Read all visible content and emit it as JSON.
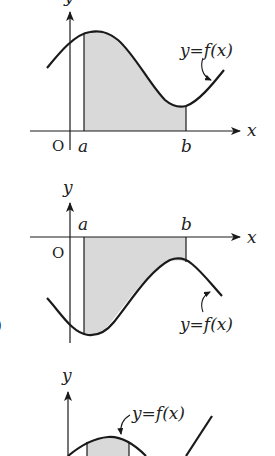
{
  "diagrams": [
    {
      "id": "graph-1",
      "description": "Curve above x-axis; shaded region between curve and x-axis from a to b",
      "labels": {
        "y_axis": "y",
        "x_axis": "x",
        "origin": "O",
        "a": "a",
        "b": "b",
        "curve": "y=f(x)"
      }
    },
    {
      "id": "graph-2",
      "description": "Curve below x-axis; shaded region between x-axis and curve from a to b",
      "labels": {
        "y_axis": "y",
        "x_axis": "x",
        "origin": "O",
        "a": "a",
        "b": "b",
        "curve": "y=f(x)"
      }
    },
    {
      "id": "graph-3",
      "description": "Curve with hump near origin; partially visible, shaded strip under hump",
      "labels": {
        "y_axis": "y",
        "curve": "y=f(x)"
      }
    }
  ],
  "partial_edge_text": ")",
  "colors": {
    "line": "#1a1a1a",
    "shade": "#d9d9d9",
    "background": "#ffffff"
  }
}
